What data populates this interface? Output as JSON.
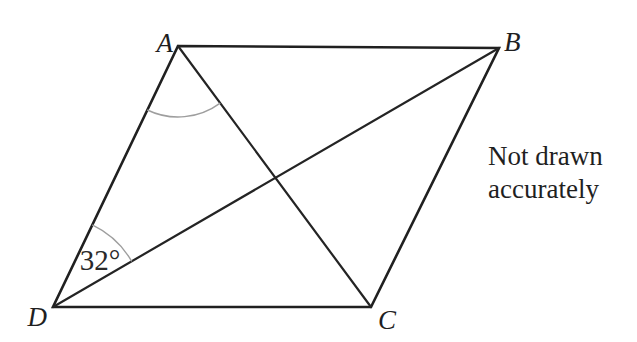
{
  "figure": {
    "vertices": {
      "a": "A",
      "b": "B",
      "c": "C",
      "d": "D"
    },
    "angle_at_d": "32°",
    "note": {
      "line1": "Not drawn",
      "line2": "accurately"
    },
    "colors": {
      "line": "#202020",
      "angle_arc": "#9e9e9e",
      "text": "#1f1f1f",
      "background": "#ffffff"
    }
  }
}
